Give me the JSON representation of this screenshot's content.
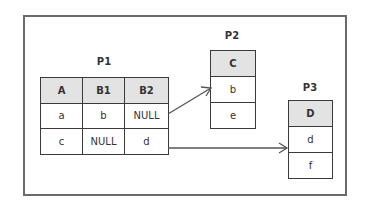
{
  "diagram": {
    "tables": [
      {
        "name": "P1",
        "columns": [
          "A",
          "B1",
          "B2"
        ],
        "rows": [
          [
            "a",
            "b",
            "NULL"
          ],
          [
            "c",
            "NULL",
            "d"
          ]
        ]
      },
      {
        "name": "P2",
        "columns": [
          "C"
        ],
        "rows": [
          [
            "b"
          ],
          [
            "e"
          ]
        ]
      },
      {
        "name": "P3",
        "columns": [
          "D"
        ],
        "rows": [
          [
            "d"
          ],
          [
            "f"
          ]
        ]
      }
    ],
    "edges": [
      {
        "from": "P1.row1.B2",
        "to": "P2.row1.C",
        "style": "arrow"
      },
      {
        "from": "P1.row2.B2",
        "to": "P3.row1.D",
        "style": "arrow"
      }
    ],
    "colors": {
      "header_fill": "#e3e3e3",
      "border": "#3a3a3a",
      "frame": "#6a6a6a",
      "arrow": "#555555"
    }
  }
}
